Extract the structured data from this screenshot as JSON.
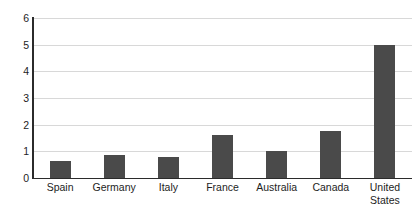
{
  "chart_data": {
    "type": "bar",
    "title": "",
    "xlabel": "",
    "ylabel": "",
    "categories": [
      "Spain",
      "Germany",
      "Italy",
      "France",
      "Australia",
      "Canada",
      "United States"
    ],
    "category_display": [
      "Spain",
      "Germany",
      "Italy",
      "France",
      "Australia",
      "Canada",
      "United\nStates"
    ],
    "values": [
      0.65,
      0.85,
      0.8,
      1.6,
      1.0,
      1.75,
      5.0
    ],
    "ylim": [
      0,
      6
    ],
    "yticks": [
      0,
      1,
      2,
      3,
      4,
      5,
      6
    ],
    "ytick_labels": [
      "0",
      "1",
      "2",
      "3",
      "4",
      "5",
      "6"
    ],
    "grid": true,
    "grid_axis": "y",
    "legend": false,
    "legend_position": "none",
    "bar_color": "#4a4a4a",
    "gridline_color": "#d8d8d8",
    "axis_color": "#2b2b2b",
    "background_color": "#ffffff"
  }
}
